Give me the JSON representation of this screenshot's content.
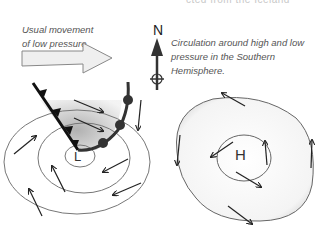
{
  "header": {
    "clipped_caption": "cted from the Iceland"
  },
  "labels": {
    "movement": "Usual movement of low pressure",
    "movement_line1": "Usual movement",
    "movement_line2": "of low pressure",
    "circulation_line1": "Circulation around high and low",
    "circulation_line2": "pressure in the Southern",
    "circulation_line3": "Hemisphere.",
    "north": "N",
    "low": "L",
    "high": "H"
  },
  "icons": {
    "movement_arrow": "big-right-arrow",
    "compass": "north-arrow-compass",
    "cold_front": "cold-front-triangles",
    "warm_front": "warm-front-semicircles"
  },
  "colors": {
    "front": "#1a1a1a",
    "isobar": "#666666",
    "shading": "#bdbdbd",
    "arrow_fill": "#f0f0f0",
    "text": "#555555"
  }
}
